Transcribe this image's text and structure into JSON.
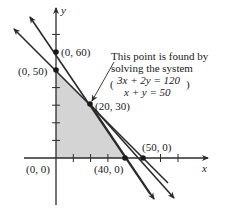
{
  "diagram": {
    "type": "linear-programming-feasible-region",
    "axes": {
      "x_label": "x",
      "y_label": "y"
    },
    "lines": [
      {
        "name": "constraint-1",
        "equation": "3x + 2y = 120",
        "y_intercept": "(0, 60)",
        "x_intercept": "(40, 0)"
      },
      {
        "name": "constraint-2",
        "equation": "x + y = 50",
        "y_intercept": "(0, 50)",
        "x_intercept": "(50, 0)"
      }
    ],
    "points": {
      "p0_60": "(0, 60)",
      "p0_50": "(0, 50)",
      "p20_30": "(20, 30)",
      "p0_0": "(0, 0)",
      "p40_0": "(40, 0)",
      "p50_0": "(50, 0)"
    },
    "annotation": {
      "line1": "This point is found by",
      "line2": "solving the system",
      "eq1": "3x + 2y = 120",
      "eq2": "x + y = 50"
    },
    "feasible_region_vertices": [
      "(0, 0)",
      "(0, 50)",
      "(20, 30)",
      "(40, 0)"
    ],
    "colors": {
      "line": "#2b2b2b",
      "shade": "#d4d4d4",
      "text": "#1a1a1a"
    }
  }
}
